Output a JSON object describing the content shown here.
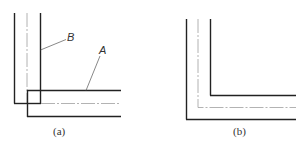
{
  "figure": {
    "panels": [
      {
        "id": "a",
        "caption": "(a)",
        "labels": [
          {
            "text": "B",
            "x": 67,
            "y": 41
          },
          {
            "text": "A",
            "x": 99,
            "y": 54
          }
        ]
      },
      {
        "id": "b",
        "caption": "(b)"
      }
    ],
    "colors": {
      "thick_line": "#222222",
      "center_line": "#9a9a9a",
      "leader_line": "#555555"
    }
  }
}
